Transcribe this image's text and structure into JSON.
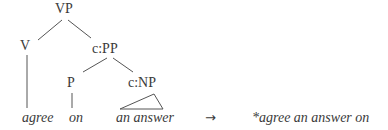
{
  "tree": {
    "root": "VP",
    "v": "V",
    "pp": "c:PP",
    "p": "P",
    "np": "c:NP",
    "leaves": {
      "agree": "agree",
      "on": "on",
      "an_answer": "an answer"
    }
  },
  "arrow": "→",
  "result": "*agree an answer on"
}
